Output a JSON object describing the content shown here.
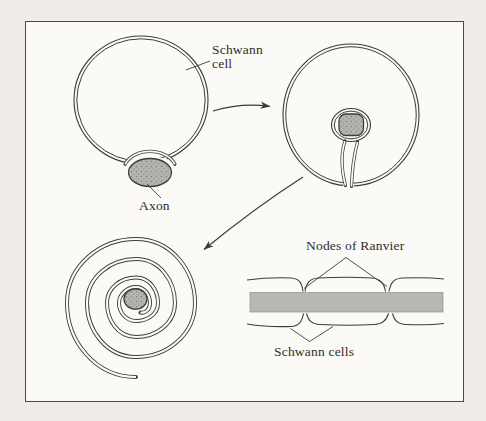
{
  "figure": {
    "labels": {
      "schwann_cell": "Schwann cell",
      "axon": "Axon",
      "nodes_of_ranvier": "Nodes of Ranvier",
      "schwann_cells": "Schwann cells"
    },
    "colors": {
      "background_outer": "#f0ede8",
      "background_inner": "#fbfaf6",
      "line": "#3d3c3a",
      "axon_fill": "#b4b3b0",
      "axon_stipple": "#6f6e69",
      "myelin_band": "#b8b7b4",
      "text": "#2f2e2c"
    }
  }
}
